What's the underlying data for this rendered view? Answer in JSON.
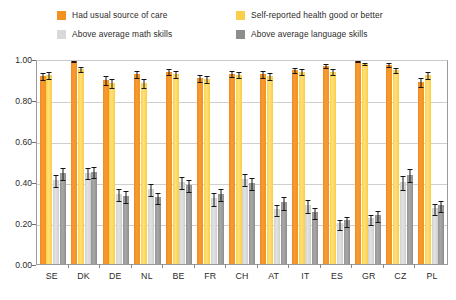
{
  "legend": {
    "items": [
      {
        "label": "Had usual source of care",
        "color": "#F5921F",
        "key": "usual_care"
      },
      {
        "label": "Self-reported health good or better",
        "color": "#FBCE4B",
        "key": "self_health"
      },
      {
        "label": "Above average math skills",
        "color": "#D9D9D9",
        "key": "math"
      },
      {
        "label": "Above average language skills",
        "color": "#8D8D8D",
        "key": "language"
      }
    ]
  },
  "axis": {
    "y_ticks": [
      "0.00",
      "0.20",
      "0.40",
      "0.60",
      "0.80",
      "1.00"
    ],
    "y_min": 0,
    "y_max": 1
  },
  "chart_data": {
    "type": "bar",
    "title": "",
    "xlabel": "",
    "ylabel": "",
    "ylim": [
      0,
      1
    ],
    "grid": true,
    "legend_position": "top",
    "orientation": "vertical",
    "error_bars": true,
    "categories": [
      "SE",
      "DK",
      "DE",
      "NL",
      "BE",
      "FR",
      "CH",
      "AT",
      "IT",
      "ES",
      "GR",
      "CZ",
      "PL"
    ],
    "series": [
      {
        "name": "Had usual source of care",
        "color": "#F5921F",
        "values": [
          0.925,
          1.0,
          0.905,
          0.935,
          0.945,
          0.915,
          0.935,
          0.935,
          0.955,
          0.975,
          1.0,
          0.98,
          0.895
        ],
        "errors": [
          0.018,
          0.004,
          0.02,
          0.016,
          0.015,
          0.018,
          0.015,
          0.016,
          0.012,
          0.01,
          0.004,
          0.008,
          0.022
        ]
      },
      {
        "name": "Self-reported health good or better",
        "color": "#FBCE4B",
        "values": [
          0.93,
          0.96,
          0.89,
          0.89,
          0.935,
          0.91,
          0.93,
          0.925,
          0.945,
          0.945,
          0.985,
          0.955,
          0.93
        ],
        "errors": [
          0.016,
          0.012,
          0.022,
          0.022,
          0.016,
          0.018,
          0.015,
          0.016,
          0.015,
          0.015,
          0.006,
          0.012,
          0.018
        ]
      },
      {
        "name": "Above average math skills",
        "color": "#D9D9D9",
        "values": [
          0.415,
          0.45,
          0.345,
          0.37,
          0.405,
          0.325,
          0.42,
          0.27,
          0.29,
          0.2,
          0.225,
          0.405,
          0.275
        ],
        "errors": [
          0.03,
          0.028,
          0.03,
          0.028,
          0.03,
          0.03,
          0.028,
          0.028,
          0.03,
          0.026,
          0.026,
          0.032,
          0.028
        ]
      },
      {
        "name": "Above average language skills",
        "color": "#8D8D8D",
        "values": [
          0.45,
          0.455,
          0.335,
          0.33,
          0.39,
          0.345,
          0.4,
          0.305,
          0.255,
          0.215,
          0.24,
          0.44,
          0.29
        ],
        "errors": [
          0.03,
          0.028,
          0.03,
          0.028,
          0.03,
          0.03,
          0.028,
          0.03,
          0.028,
          0.026,
          0.026,
          0.032,
          0.028
        ]
      }
    ]
  }
}
